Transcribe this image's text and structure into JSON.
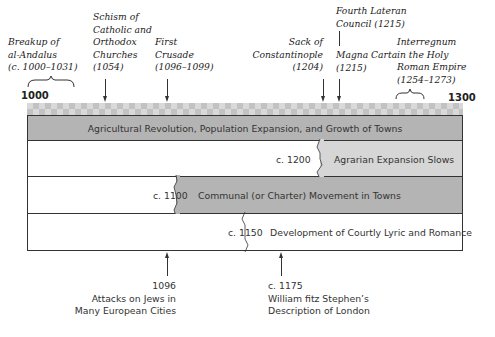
{
  "timeline": {
    "start_label": "1000",
    "end_label": "1300",
    "start_year": 1000,
    "end_year": 1300
  },
  "top_events": [
    {
      "label_lines": [
        "Breakup of",
        "al-Andalus",
        "(c. 1000–1031)"
      ],
      "marker": "brace",
      "range": [
        1000,
        1031
      ]
    },
    {
      "label_lines": [
        "Schism of",
        "Catholic and",
        "Orthodox",
        "Churches",
        "(1054)"
      ],
      "marker": "arrow",
      "year": 1054
    },
    {
      "label_lines": [
        "First",
        "Crusade",
        "(1096–1099)"
      ],
      "marker": "arrow",
      "year": 1096
    },
    {
      "label_lines": [
        "Sack of",
        "Constantinople",
        "(1204)"
      ],
      "marker": "arrow",
      "year": 1204
    },
    {
      "label_lines": [
        "Fourth Lateran",
        "Council (1215)"
      ],
      "marker": "arrow",
      "year": 1215
    },
    {
      "label_lines": [
        "Magna Carta",
        "(1215)"
      ],
      "marker": "arrow",
      "year": 1215
    },
    {
      "label_lines": [
        "Interregnum",
        "in the Holy",
        "Roman Empire",
        "(1254–1273)"
      ],
      "marker": "brace",
      "range": [
        1254,
        1273
      ]
    }
  ],
  "bands": [
    {
      "label": "Agricultural Revolution, Population Expansion, and Growth of Towns",
      "start_label": "",
      "start_year": 1000,
      "fill": "#b4b4b4"
    },
    {
      "label": "Agrarian Expansion Slows",
      "start_label": "c. 1200",
      "start_year": 1200,
      "fill": "#d6d6d6"
    },
    {
      "label": "Communal (or Charter) Movement in Towns",
      "start_label": "c. 1100",
      "start_year": 1100,
      "fill": "#b4b4b4"
    },
    {
      "label": "Development of Courtly Lyric and Romance",
      "start_label": "c. 1150",
      "start_year": 1150,
      "fill": "#ffffff"
    }
  ],
  "bottom_events": [
    {
      "year_label": "1096",
      "label_lines": [
        "Attacks on Jews in",
        "Many European Cities"
      ],
      "year": 1096
    },
    {
      "year_label": "c. 1175",
      "label_lines": [
        "William fitz Stephen’s",
        "Description of London"
      ],
      "year": 1175
    }
  ],
  "colors": {
    "dark_band": "#b4b4b4",
    "light_band": "#d6d6d6",
    "line": "#333333"
  }
}
